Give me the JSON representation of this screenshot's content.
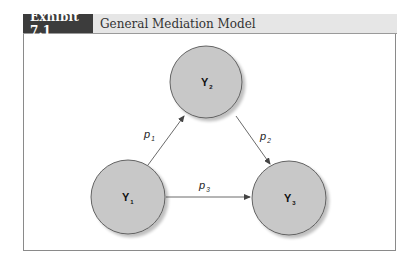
{
  "exhibit": {
    "label": "Exhibit 7.1",
    "title": "General Mediation Model"
  },
  "colors": {
    "header_label_bg": "#3c3c3c",
    "header_bg": "#e6e6e6",
    "node_fill": "#c8c8c8",
    "node_stroke": "#555555",
    "arrow": "#444444"
  },
  "diagram": {
    "nodes": [
      {
        "id": "Y1",
        "letter": "Y",
        "subscript": "1"
      },
      {
        "id": "Y2",
        "letter": "Y",
        "subscript": "2"
      },
      {
        "id": "Y3",
        "letter": "Y",
        "subscript": "3"
      }
    ],
    "edges": [
      {
        "from": "Y1",
        "to": "Y2",
        "letter": "p",
        "subscript": "1"
      },
      {
        "from": "Y2",
        "to": "Y3",
        "letter": "p",
        "subscript": "2"
      },
      {
        "from": "Y1",
        "to": "Y3",
        "letter": "p",
        "subscript": "3"
      }
    ]
  }
}
